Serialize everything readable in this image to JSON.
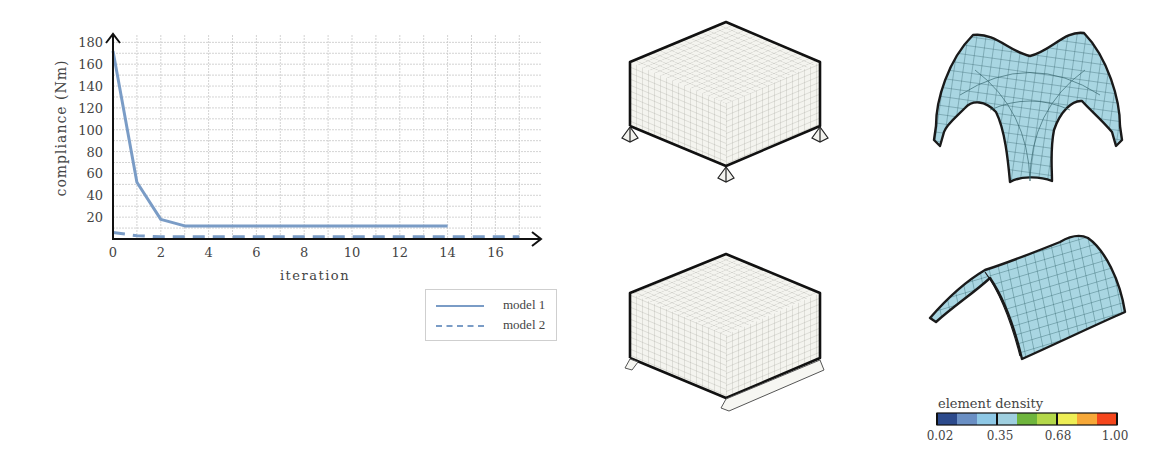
{
  "chart_data": {
    "type": "line",
    "title": "",
    "xlabel": "iteration",
    "ylabel": "compliance (Nm)",
    "xlim": [
      0,
      17.5
    ],
    "ylim": [
      0,
      185
    ],
    "x_ticks": [
      0,
      2,
      4,
      6,
      8,
      10,
      12,
      14,
      16
    ],
    "y_ticks": [
      20,
      40,
      60,
      80,
      100,
      120,
      140,
      160,
      180
    ],
    "grid": true,
    "legend_position": "lower-right (below plot)",
    "series": [
      {
        "name": "model 1",
        "style": "solid",
        "color": "#7a9cc6",
        "x": [
          0,
          1,
          2,
          3,
          4,
          5,
          6,
          7,
          8,
          9,
          10,
          11,
          12,
          13,
          14
        ],
        "values": [
          172,
          52,
          18,
          12,
          12,
          12,
          12,
          12,
          12,
          12,
          12,
          12,
          12,
          12,
          12
        ]
      },
      {
        "name": "model 2",
        "style": "dashed",
        "color": "#7a9cc6",
        "x": [
          0,
          1,
          2,
          3,
          4,
          5,
          6,
          7,
          8,
          9,
          10,
          11,
          12,
          13,
          14,
          15,
          16,
          17
        ],
        "values": [
          6,
          3,
          2,
          2,
          2,
          2,
          2,
          2,
          2,
          2,
          2,
          2,
          2,
          2,
          2,
          2,
          2,
          2
        ]
      }
    ]
  },
  "axes": {
    "ylabel": "compliance (Nm)",
    "xlabel": "iteration",
    "y_tick_labels": [
      "180",
      "160",
      "140",
      "120",
      "100",
      "80",
      "60",
      "40",
      "20"
    ],
    "x_tick_labels": [
      "0",
      "2",
      "4",
      "6",
      "8",
      "10",
      "12",
      "14",
      "16"
    ]
  },
  "legend": {
    "items": [
      {
        "label": "model 1",
        "style": "solid"
      },
      {
        "label": "model 2",
        "style": "dashed"
      }
    ]
  },
  "models": [
    {
      "name": "model 1",
      "support": "four point supports",
      "result": "four-legged shell"
    },
    {
      "name": "model 2",
      "support": "two line supports",
      "result": "barrel vault shell"
    }
  ],
  "colorbar": {
    "title": "element density",
    "tick_labels": [
      "0.02",
      "0.35",
      "0.68",
      "1.00"
    ],
    "colors": [
      "#2c4a8c",
      "#6a8fc4",
      "#8ec8e6",
      "#9fcfdf",
      "#6fb53d",
      "#b4d84a",
      "#eeee55",
      "#f7a838",
      "#f5461c"
    ]
  },
  "colors": {
    "line": "#7a9cc6",
    "axis": "#111111",
    "grid": "#c8c8c8",
    "shell_fill": "#a9d6e2",
    "shell_mesh": "#2f5f66"
  }
}
